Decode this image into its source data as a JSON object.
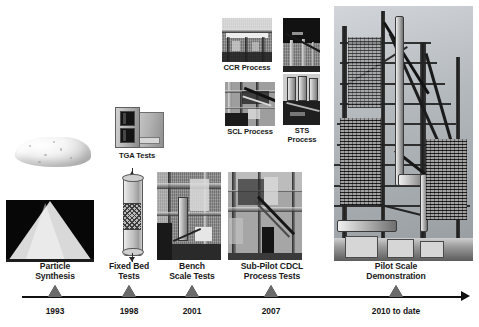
{
  "figure": {
    "type": "process-development-timeline",
    "axis": {
      "start_x": 22,
      "end_x": 462,
      "y": 296
    }
  },
  "timeline": {
    "milestones": [
      {
        "id": "particle-synthesis",
        "label": "Particle\nSynthesis",
        "year": "1993",
        "marker_x": 55
      },
      {
        "id": "fixed-bed-tests",
        "label": "Fixed Bed\nTests",
        "year": "1998",
        "marker_x": 129
      },
      {
        "id": "bench-scale-tests",
        "label": "Bench\nScale Tests",
        "year": "2001",
        "marker_x": 192
      },
      {
        "id": "sub-pilot-cdcl-process-tests",
        "label": "Sub-Pilot CDCL\nProcess Tests",
        "year": "2007",
        "marker_x": 271
      },
      {
        "id": "pilot-scale-demonstration",
        "label": "Pilot Scale\nDemonstration",
        "year": "2010 to date",
        "marker_x": 396
      }
    ]
  },
  "images": {
    "particle_synthesis_top": {
      "caption": "",
      "subject": "white-powder-pile"
    },
    "particle_synthesis_bottom": {
      "caption": "",
      "subject": "powder-cone-on-black"
    },
    "tga": {
      "caption": "TGA Tests",
      "subject": "thermogravimetric-analyzer"
    },
    "fixed_bed": {
      "caption": "",
      "subject": "packed-bed-reactor-column"
    },
    "bench_scale": {
      "caption": "",
      "subject": "bench-scale-reactor-rig"
    },
    "ccr": {
      "caption": "CCR Process",
      "subject": "ccr-process-unit"
    },
    "scl": {
      "caption": "SCL Process",
      "subject": "scl-process-unit"
    },
    "sts": {
      "caption": "STS\nProcess",
      "subject": "sts-process-unit"
    },
    "sub_pilot": {
      "caption": "",
      "subject": "sub-pilot-cdcl-unit"
    },
    "pilot": {
      "caption": "",
      "subject": "pilot-scale-plant-steel-structure"
    }
  },
  "colors": {
    "axis": "#111111",
    "marker_fill": "#6b6b6b",
    "marker_stroke": "#1c1c1c",
    "text": "#141414",
    "background": "#ffffff"
  }
}
